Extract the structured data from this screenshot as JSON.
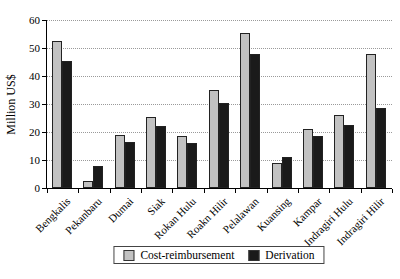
{
  "chart_data": {
    "type": "bar",
    "title": "",
    "ylabel": "Million US$",
    "xlabel": "",
    "ylim": [
      0,
      60
    ],
    "yticks": [
      0,
      10,
      20,
      30,
      40,
      50,
      60
    ],
    "grid": "horizontal-dotted",
    "legend_position": "bottom-center",
    "categories": [
      "Bengkalis",
      "Pekanbaru",
      "Dumai",
      "Siak",
      "Rokan Hulu",
      "Roakn Hilir",
      "Pelalawan",
      "Kuansing",
      "Kampar",
      "Indragiri Hulu",
      "Indragiri Hilir"
    ],
    "series": [
      {
        "name": "Cost-reimbursement",
        "color": "#c2c2c2",
        "values": [
          52.5,
          2.5,
          19,
          25.5,
          18.5,
          35,
          55.5,
          9,
          21,
          26,
          48
        ]
      },
      {
        "name": "Derivation",
        "color": "#1a1a1a",
        "values": [
          45.5,
          8,
          16.5,
          22,
          16,
          30.5,
          48,
          11,
          18.5,
          22.5,
          28.5
        ]
      }
    ],
    "colors": {
      "axis": "#000000",
      "gridline": "#9a9a9a",
      "bar_border": "#222222",
      "background": "#ffffff"
    }
  }
}
